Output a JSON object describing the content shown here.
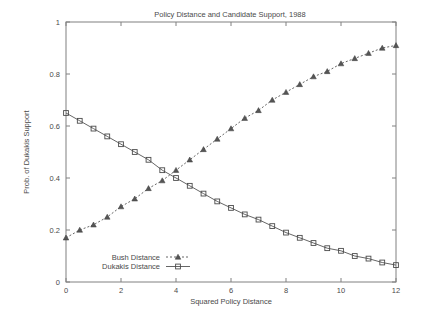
{
  "chart_data": {
    "type": "line",
    "title": "Policy Distance and Candidate Support, 1988",
    "xlabel": "Squared Policy Distance",
    "ylabel": "Prob. of Dukakis Support",
    "xlim": [
      0,
      12
    ],
    "ylim": [
      0,
      1
    ],
    "xticks": [
      0,
      2,
      4,
      6,
      8,
      10,
      12
    ],
    "xtick_labels": [
      "0",
      "2",
      "4",
      "6",
      "8",
      "10",
      "12"
    ],
    "yticks": [
      0,
      0.2,
      0.4,
      0.6,
      0.8,
      1
    ],
    "ytick_labels": [
      "0",
      "0.2",
      "0.4",
      "0.6",
      "0.8",
      "1"
    ],
    "grid": false,
    "legend_position": "inside-bottom-left",
    "x": [
      0,
      0.5,
      1,
      1.5,
      2,
      2.5,
      3,
      3.5,
      4,
      4.5,
      5,
      5.5,
      6,
      6.5,
      7,
      7.5,
      8,
      8.5,
      9,
      9.5,
      10,
      10.5,
      11,
      11.5,
      12
    ],
    "series": [
      {
        "name": "Bush Distance",
        "marker": "triangle",
        "line_style": "dashed",
        "color": "#555555",
        "values": [
          0.17,
          0.2,
          0.22,
          0.25,
          0.29,
          0.32,
          0.36,
          0.39,
          0.43,
          0.47,
          0.51,
          0.55,
          0.59,
          0.63,
          0.66,
          0.7,
          0.73,
          0.76,
          0.79,
          0.81,
          0.84,
          0.86,
          0.88,
          0.9,
          0.91
        ]
      },
      {
        "name": "Dukakis Distance",
        "marker": "square",
        "line_style": "solid",
        "color": "#555555",
        "values": [
          0.65,
          0.62,
          0.59,
          0.56,
          0.53,
          0.5,
          0.47,
          0.43,
          0.4,
          0.37,
          0.34,
          0.31,
          0.285,
          0.26,
          0.24,
          0.215,
          0.19,
          0.17,
          0.15,
          0.13,
          0.12,
          0.1,
          0.09,
          0.075,
          0.065
        ]
      }
    ]
  }
}
